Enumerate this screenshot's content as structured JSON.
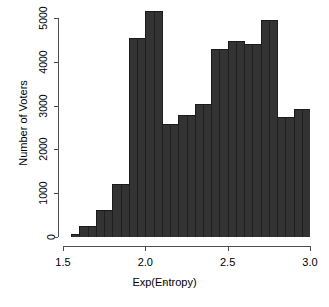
{
  "chart_data": {
    "type": "bar",
    "title": "",
    "xlabel": "Exp(Entropy)",
    "ylabel": "Number of Voters",
    "xlim": [
      1.5,
      3.0
    ],
    "ylim": [
      0,
      5200
    ],
    "grid": false,
    "legend": null,
    "bin_width": 0.05,
    "bar_color": "#333333",
    "bar_edge_color": "#1a1a1a",
    "axis_color": "#4d4d4d",
    "xticks": [
      "1.5",
      "2.0",
      "2.5",
      "3.0"
    ],
    "xtick_values": [
      1.5,
      2.0,
      2.5,
      3.0
    ],
    "yticks": [
      "0",
      "1000",
      "2000",
      "3000",
      "4000",
      "5000"
    ],
    "ytick_values": [
      0,
      1000,
      2000,
      3000,
      4000,
      5000
    ],
    "bins": [
      {
        "x0": 1.5,
        "x1": 1.55,
        "value": 0
      },
      {
        "x0": 1.55,
        "x1": 1.6,
        "value": 60
      },
      {
        "x0": 1.6,
        "x1": 1.65,
        "value": 260
      },
      {
        "x0": 1.65,
        "x1": 1.7,
        "value": 260
      },
      {
        "x0": 1.7,
        "x1": 1.75,
        "value": 620
      },
      {
        "x0": 1.75,
        "x1": 1.8,
        "value": 620
      },
      {
        "x0": 1.8,
        "x1": 1.85,
        "value": 1200
      },
      {
        "x0": 1.85,
        "x1": 1.9,
        "value": 1200
      },
      {
        "x0": 1.9,
        "x1": 1.95,
        "value": 4550
      },
      {
        "x0": 1.95,
        "x1": 2.0,
        "value": 4550
      },
      {
        "x0": 2.0,
        "x1": 2.05,
        "value": 5150
      },
      {
        "x0": 2.05,
        "x1": 2.1,
        "value": 5150
      },
      {
        "x0": 2.1,
        "x1": 2.15,
        "value": 2570
      },
      {
        "x0": 2.15,
        "x1": 2.2,
        "value": 2570
      },
      {
        "x0": 2.2,
        "x1": 2.25,
        "value": 2790
      },
      {
        "x0": 2.25,
        "x1": 2.3,
        "value": 2790
      },
      {
        "x0": 2.3,
        "x1": 2.35,
        "value": 3040
      },
      {
        "x0": 2.35,
        "x1": 2.4,
        "value": 3040
      },
      {
        "x0": 2.4,
        "x1": 2.45,
        "value": 4300
      },
      {
        "x0": 2.45,
        "x1": 2.5,
        "value": 4300
      },
      {
        "x0": 2.5,
        "x1": 2.55,
        "value": 4480
      },
      {
        "x0": 2.55,
        "x1": 2.6,
        "value": 4480
      },
      {
        "x0": 2.6,
        "x1": 2.65,
        "value": 4400
      },
      {
        "x0": 2.65,
        "x1": 2.7,
        "value": 4400
      },
      {
        "x0": 2.7,
        "x1": 2.75,
        "value": 4950
      },
      {
        "x0": 2.75,
        "x1": 2.8,
        "value": 4950
      },
      {
        "x0": 2.8,
        "x1": 2.85,
        "value": 2730
      },
      {
        "x0": 2.85,
        "x1": 2.9,
        "value": 2730
      },
      {
        "x0": 2.9,
        "x1": 2.95,
        "value": 2920
      },
      {
        "x0": 2.95,
        "x1": 3.0,
        "value": 2920
      }
    ],
    "merged_bars": [
      {
        "x0": 1.5,
        "x1": 1.55,
        "value": 0
      },
      {
        "x0": 1.55,
        "x1": 1.6,
        "value": 60
      },
      {
        "x0": 1.6,
        "x1": 1.7,
        "value": 260
      },
      {
        "x0": 1.7,
        "x1": 1.8,
        "value": 620
      },
      {
        "x0": 1.8,
        "x1": 1.9,
        "value": 1200
      },
      {
        "x0": 1.9,
        "x1": 2.0,
        "value": 4550
      },
      {
        "x0": 2.0,
        "x1": 2.1,
        "value": 5150
      },
      {
        "x0": 2.1,
        "x1": 2.2,
        "value": 2570
      },
      {
        "x0": 2.2,
        "x1": 2.3,
        "value": 2790
      },
      {
        "x0": 2.3,
        "x1": 2.4,
        "value": 3040
      },
      {
        "x0": 2.4,
        "x1": 2.5,
        "value": 4300
      },
      {
        "x0": 2.5,
        "x1": 2.6,
        "value": 4480
      },
      {
        "x0": 2.6,
        "x1": 2.7,
        "value": 4400
      },
      {
        "x0": 2.7,
        "x1": 2.8,
        "value": 4950
      },
      {
        "x0": 2.8,
        "x1": 2.9,
        "value": 2730
      },
      {
        "x0": 2.9,
        "x1": 3.0,
        "value": 2920
      }
    ]
  },
  "geometry": {
    "plot_left_px": 63,
    "plot_right_px": 310,
    "baseline_px": 237,
    "top_px": 18,
    "x_min": 1.5,
    "x_max": 3.0,
    "y_min": 0,
    "y_max": 5000,
    "y_top_px": 18
  }
}
